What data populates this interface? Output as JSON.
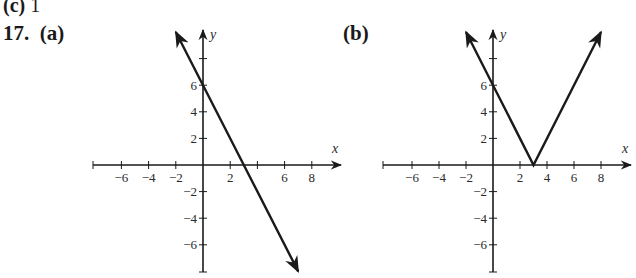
{
  "header": {
    "prev_part_label": "(c)",
    "prev_part_answer": "1",
    "problem_number": "17.",
    "part_a_label": "(a)",
    "part_b_label": "(b)"
  },
  "colors": {
    "ink": "#1a1a1a",
    "background": "#ffffff"
  },
  "chart_data": [
    {
      "type": "line",
      "title": "(a)",
      "function": "y = -2x + 6",
      "xlabel": "x",
      "ylabel": "y",
      "xlim": [
        -8,
        10
      ],
      "ylim": [
        -8,
        10
      ],
      "x_ticks": [
        -6,
        -4,
        -2,
        2,
        6,
        8
      ],
      "y_ticks": [
        6,
        4,
        2,
        -2,
        -4,
        -6
      ],
      "grid": false,
      "series": [
        {
          "name": "y = -2x + 6",
          "x": [
            -2,
            0,
            3,
            7
          ],
          "y": [
            10,
            6,
            0,
            -8
          ],
          "arrows": "both"
        }
      ],
      "annotations": {
        "y_intercept": [
          0,
          6
        ],
        "x_intercept": [
          3,
          0
        ]
      }
    },
    {
      "type": "line",
      "title": "(b)",
      "function": "y = |-2x + 6|",
      "xlabel": "x",
      "ylabel": "y",
      "xlim": [
        -8,
        10
      ],
      "ylim": [
        -8,
        10
      ],
      "x_ticks": [
        -6,
        -4,
        -2,
        2,
        4,
        6,
        8
      ],
      "y_ticks": [
        6,
        4,
        2,
        -2,
        -4,
        -6
      ],
      "grid": false,
      "series": [
        {
          "name": "y = |-2x + 6|",
          "x": [
            -2,
            0,
            3,
            8
          ],
          "y": [
            10,
            6,
            0,
            10
          ],
          "arrows": "both"
        }
      ],
      "annotations": {
        "vertex": [
          3,
          0
        ],
        "y_intercept": [
          0,
          6
        ]
      }
    }
  ]
}
